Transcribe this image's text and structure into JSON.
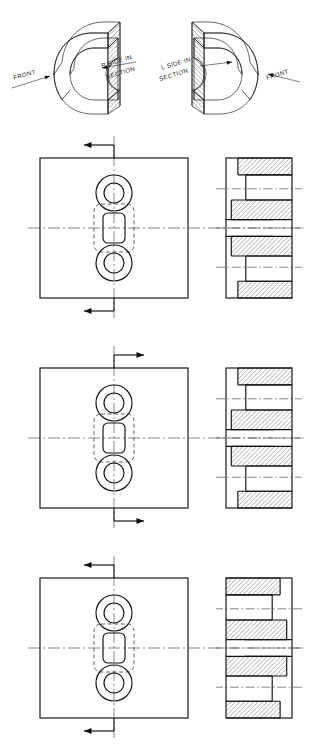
{
  "sheet": {
    "title": "Full Section View Conventions Plate",
    "background": "#ffffff",
    "ink": "#111111",
    "line_weights": {
      "object": 1.15,
      "thin": 0.55,
      "center": 0.5,
      "hidden": 0.65,
      "hatch": 0.5
    }
  },
  "pictorials": [
    {
      "id": "pictorial-left",
      "labels": [
        {
          "name": "front-label",
          "text": "FRONT",
          "x": 14,
          "y": 80,
          "rotate": -16
        },
        {
          "name": "r-side-label-line1",
          "text": "R SIDE IN",
          "x": 102,
          "y": 68,
          "rotate": -17
        },
        {
          "name": "r-side-label-line2",
          "text": "SECTION",
          "x": 107,
          "y": 79,
          "rotate": -17
        }
      ]
    },
    {
      "id": "pictorial-right",
      "labels": [
        {
          "name": "l-side-label-line1",
          "text": "L  SIDE  IN",
          "x": 162,
          "y": 70,
          "rotate": -17
        },
        {
          "name": "l-side-label-line2",
          "text": "SECTION",
          "x": 160,
          "y": 81,
          "rotate": -17
        },
        {
          "name": "front-label",
          "text": "FRONT",
          "x": 267,
          "y": 80,
          "rotate": -17
        }
      ]
    }
  ],
  "view_sets": [
    {
      "id": "view-set-1",
      "index": 1,
      "arrow_direction": "left",
      "side_view_mirrored": false,
      "front_view": {
        "box": {
          "x": 40,
          "y": 158,
          "w": 148,
          "h": 140
        },
        "counterbores": [
          {
            "cx": 114,
            "cy": 193,
            "r_outer": 18,
            "r_inner": 10
          },
          {
            "cx": 114,
            "cy": 263,
            "r_outer": 18,
            "r_inner": 10
          }
        ],
        "center_slot": {
          "cx": 114,
          "cy": 228,
          "w": 22,
          "h": 30,
          "radius": 5
        },
        "hidden_outline": {
          "cx": 114,
          "cy": 228,
          "w": 40,
          "h": 48,
          "radius": 7
        }
      },
      "cutting_plane": {
        "top_arrow": {
          "x": 114,
          "y": 145,
          "dir": "left"
        },
        "bottom_arrow": {
          "x": 114,
          "y": 311,
          "dir": "left"
        }
      },
      "side_view": {
        "x": 226,
        "y": 158,
        "w": 66,
        "h": 140
      }
    },
    {
      "id": "view-set-2",
      "index": 2,
      "arrow_direction": "right",
      "side_view_mirrored": false,
      "front_view": {
        "box": {
          "x": 40,
          "y": 368,
          "w": 148,
          "h": 140
        },
        "counterbores": [
          {
            "cx": 114,
            "cy": 403,
            "r_outer": 18,
            "r_inner": 10
          },
          {
            "cx": 114,
            "cy": 473,
            "r_outer": 18,
            "r_inner": 10
          }
        ],
        "center_slot": {
          "cx": 114,
          "cy": 438,
          "w": 22,
          "h": 30,
          "radius": 5
        },
        "hidden_outline": {
          "cx": 114,
          "cy": 438,
          "w": 40,
          "h": 48,
          "radius": 7
        }
      },
      "cutting_plane": {
        "top_arrow": {
          "x": 114,
          "y": 355,
          "dir": "right"
        },
        "bottom_arrow": {
          "x": 114,
          "y": 521,
          "dir": "right"
        }
      },
      "side_view": {
        "x": 226,
        "y": 368,
        "w": 66,
        "h": 140
      }
    },
    {
      "id": "view-set-3",
      "index": 3,
      "arrow_direction": "left",
      "side_view_mirrored": true,
      "front_view": {
        "box": {
          "x": 40,
          "y": 578,
          "w": 148,
          "h": 140
        },
        "counterbores": [
          {
            "cx": 114,
            "cy": 613,
            "r_outer": 18,
            "r_inner": 10
          },
          {
            "cx": 114,
            "cy": 683,
            "r_outer": 18,
            "r_inner": 10
          }
        ],
        "center_slot": {
          "cx": 114,
          "cy": 648,
          "w": 22,
          "h": 30,
          "radius": 5
        },
        "hidden_outline": {
          "cx": 114,
          "cy": 648,
          "w": 40,
          "h": 48,
          "radius": 7
        }
      },
      "cutting_plane": {
        "top_arrow": {
          "x": 114,
          "y": 565,
          "dir": "left"
        },
        "bottom_arrow": {
          "x": 114,
          "y": 731,
          "dir": "left"
        }
      },
      "side_view": {
        "x": 226,
        "y": 578,
        "w": 66,
        "h": 140
      }
    }
  ],
  "section_profile": {
    "description": "Stepped counterbored section: hatched material with recessed pockets, symmetric about horizontal center",
    "hatch_angle_deg": 45,
    "hatch_spacing": 3.2,
    "bands": [
      {
        "name": "top-outer-flange",
        "y0": 0.0,
        "y1": 0.12,
        "x0": 0.18,
        "x1": 1.0,
        "filled": true
      },
      {
        "name": "top-bore-clearance",
        "y0": 0.12,
        "y1": 0.3,
        "x0": 0.3,
        "x1": 1.0,
        "filled": false
      },
      {
        "name": "top-web",
        "y0": 0.3,
        "y1": 0.44,
        "x0": 0.08,
        "x1": 1.0,
        "filled": true
      },
      {
        "name": "mid-cavity",
        "y0": 0.44,
        "y1": 0.56,
        "x0": 0.0,
        "x1": 0.72,
        "filled": false
      },
      {
        "name": "bottom-web",
        "y0": 0.56,
        "y1": 0.7,
        "x0": 0.08,
        "x1": 1.0,
        "filled": true
      },
      {
        "name": "bottom-bore-clearance",
        "y0": 0.7,
        "y1": 0.88,
        "x0": 0.3,
        "x1": 1.0,
        "filled": false
      },
      {
        "name": "bottom-outer-flange",
        "y0": 0.88,
        "y1": 1.0,
        "x0": 0.18,
        "x1": 1.0,
        "filled": true
      }
    ],
    "center_lines_at": [
      0.22,
      0.5,
      0.78
    ]
  }
}
